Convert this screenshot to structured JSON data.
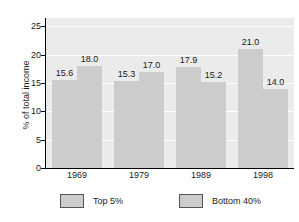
{
  "chart_data": {
    "type": "bar",
    "title": "",
    "xlabel": "",
    "ylabel": "% of total income",
    "categories": [
      "1969",
      "1979",
      "1989",
      "1998"
    ],
    "series": [
      {
        "name": "Top 5%",
        "values": [
          15.6,
          15.3,
          17.9,
          21.0
        ]
      },
      {
        "name": "Bottom 40%",
        "values": [
          18.0,
          17.0,
          15.2,
          14.0
        ]
      }
    ],
    "value_labels": [
      [
        "15.6",
        "15.3",
        "17.9",
        "21.0"
      ],
      [
        "18.0",
        "17.0",
        "15.2",
        "14.0"
      ]
    ],
    "ylim": [
      0,
      26.5
    ],
    "yticks": [
      0,
      5,
      10,
      15,
      20,
      25
    ],
    "ytick_labels": [
      "0",
      "5",
      "10",
      "15",
      "20",
      "25"
    ],
    "grid": true,
    "grid_orientation": "horizontal",
    "legend_position": "bottom",
    "colors": {
      "bar": "#cccccc",
      "plot_background": "#ebebeb",
      "gridline": "#ffffff",
      "axis": "#000000",
      "text": "#1a1a1a",
      "legend_swatch_border": "#555555",
      "page_background": "#ffffff"
    }
  },
  "legend": {
    "entries": [
      {
        "label": "Top 5%"
      },
      {
        "label": "Bottom 40%"
      }
    ]
  }
}
